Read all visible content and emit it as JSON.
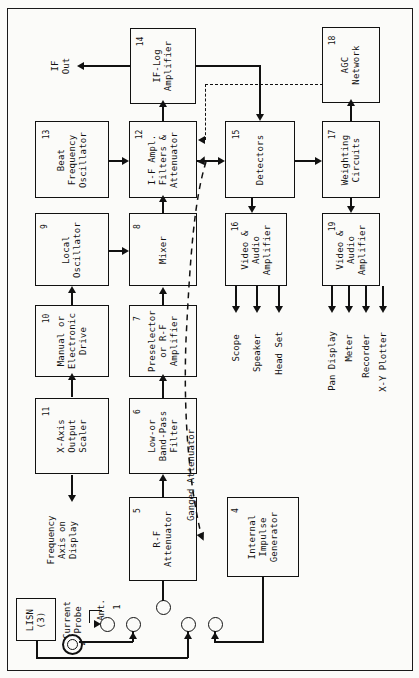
{
  "figure": {
    "orientation": "rotated-90-ccw",
    "line_color": "#111111",
    "background": "#fbfbf9"
  },
  "blocks": [
    {
      "id": "b14",
      "num": "14",
      "lines": [
        "IF-Log",
        "Amplifier"
      ],
      "name": "if-log-amplifier"
    },
    {
      "id": "b13",
      "num": "13",
      "lines": [
        "Beat",
        "Frequency",
        "Oscillator"
      ],
      "name": "beat-frequency-oscillator"
    },
    {
      "id": "b12",
      "num": "12",
      "lines": [
        "I-F Ampl.",
        "Filters &",
        "Attenuator"
      ],
      "name": "if-amplifier-filters-attenuator"
    },
    {
      "id": "b18",
      "num": "18",
      "lines": [
        "AGC",
        "Network"
      ],
      "name": "agc-network"
    },
    {
      "id": "b15",
      "num": "15",
      "lines": [
        "Detectors"
      ],
      "name": "detectors"
    },
    {
      "id": "b17",
      "num": "17",
      "lines": [
        "Weighting",
        "Circuits"
      ],
      "name": "weighting-circuits"
    },
    {
      "id": "b9",
      "num": "9",
      "lines": [
        "Local",
        "Oscillator"
      ],
      "name": "local-oscillator"
    },
    {
      "id": "b8",
      "num": "8",
      "lines": [
        "Mixer"
      ],
      "name": "mixer"
    },
    {
      "id": "b16",
      "num": "16",
      "lines": [
        "Video &",
        "Audio",
        "Amplifier"
      ],
      "name": "video-audio-amplifier-16"
    },
    {
      "id": "b19",
      "num": "19",
      "lines": [
        "Video &",
        "Audio",
        "Amplifier"
      ],
      "name": "video-audio-amplifier-19"
    },
    {
      "id": "b10",
      "num": "10",
      "lines": [
        "Manual or",
        "Electronic",
        "Drive"
      ],
      "name": "manual-or-electronic-drive"
    },
    {
      "id": "b7",
      "num": "7",
      "lines": [
        "Preselector",
        "or R-F",
        "Amplifier"
      ],
      "name": "preselector-or-rf-amplifier"
    },
    {
      "id": "b11",
      "num": "11",
      "lines": [
        "X-Axis",
        "Output",
        "Scaler"
      ],
      "name": "x-axis-output-scaler"
    },
    {
      "id": "b6",
      "num": "6",
      "lines": [
        "Low-or",
        "Band-Pass",
        "Filter"
      ],
      "name": "low-or-band-pass-filter"
    },
    {
      "id": "b5",
      "num": "5",
      "lines": [
        "R-F",
        "Attenuator"
      ],
      "name": "rf-attenuator"
    },
    {
      "id": "b4",
      "num": "4",
      "lines": [
        "Internal",
        "Impulse",
        "Generator"
      ],
      "name": "internal-impulse-generator"
    },
    {
      "id": "b3",
      "num": "",
      "lines": [
        "LISN",
        "(3)"
      ],
      "name": "lisn"
    }
  ],
  "labels": {
    "if_out": "IF\nOut",
    "if_out_l1": "IF",
    "if_out_l2": "Out",
    "ganged_attenuator": "Ganged Attenuator",
    "freq_axis_l1": "Frequency",
    "freq_axis_l2": "Axis on",
    "freq_axis_l3": "Display",
    "current_probe_l1": "Current",
    "current_probe_l2": "Probe",
    "antenna": "Ant.",
    "port_1": "1",
    "port_2": "2",
    "lisn_l1": "LISN",
    "lisn_l2": "(3)"
  },
  "outputs_16": [
    "Scope",
    "Speaker",
    "Head Set"
  ],
  "outputs_19": [
    "Pan Display",
    "Meter",
    "Recorder",
    "X-Y Plotter"
  ],
  "connections": [
    {
      "from": "b12",
      "to": "b14",
      "style": "solid",
      "name": "if12-to-iflog14"
    },
    {
      "from": "b14",
      "to": "if-out",
      "style": "solid",
      "name": "iflog14-to-if-out"
    },
    {
      "from": "b13",
      "to": "b12",
      "style": "solid",
      "name": "bfo13-to-if12"
    },
    {
      "from": "b12",
      "to": "b15",
      "style": "solid",
      "name": "if12-to-detectors15"
    },
    {
      "from": "b14",
      "to": "b15",
      "style": "solid",
      "name": "iflog14-to-detectors15"
    },
    {
      "from": "b18",
      "to": "b12",
      "style": "dashed",
      "name": "agc18-to-if12"
    },
    {
      "from": "b17",
      "to": "b18",
      "style": "solid",
      "name": "weighting17-to-agc18"
    },
    {
      "from": "b15",
      "to": "b17",
      "style": "solid",
      "name": "detectors15-to-weighting17"
    },
    {
      "from": "b15",
      "to": "b16",
      "style": "solid",
      "name": "detectors15-to-videoamp16"
    },
    {
      "from": "b17",
      "to": "b19",
      "style": "solid",
      "name": "weighting17-to-videoamp19"
    },
    {
      "from": "b9",
      "to": "b8",
      "style": "solid",
      "name": "lo9-to-mixer8"
    },
    {
      "from": "b8",
      "to": "b12",
      "style": "solid",
      "name": "mixer8-to-if12"
    },
    {
      "from": "b10",
      "to": "b9",
      "style": "solid",
      "name": "drive10-to-lo9"
    },
    {
      "from": "b11",
      "to": "b10",
      "style": "solid",
      "name": "scaler11-to-drive10"
    },
    {
      "from": "b7",
      "to": "b8",
      "style": "solid",
      "name": "preselector7-to-mixer8"
    },
    {
      "from": "b6",
      "to": "b7",
      "style": "solid",
      "name": "filter6-to-preselector7"
    },
    {
      "from": "b5",
      "to": "b6",
      "style": "solid",
      "name": "attenuator5-to-filter6"
    },
    {
      "from": "b11",
      "to": "freq-axis",
      "style": "solid",
      "name": "scaler11-to-freq-axis"
    },
    {
      "from": "b5",
      "to": "b12",
      "style": "dashed",
      "name": "ganged-attenuator-link"
    }
  ]
}
